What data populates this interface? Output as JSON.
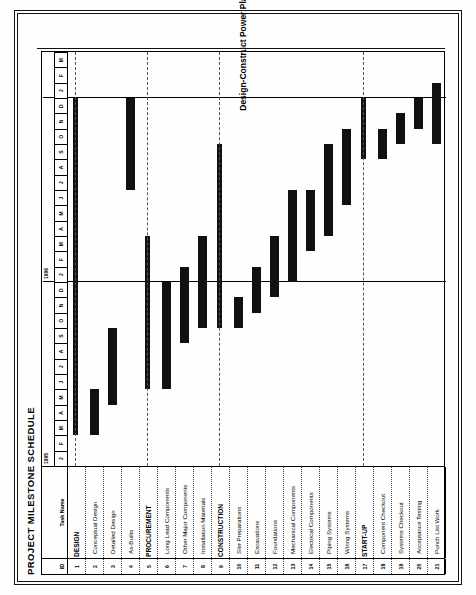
{
  "document": {
    "title": "PROJECT MILESTONE SCHEDULE",
    "caption": "Design-Construct Power Plant Project"
  },
  "columns": {
    "id_header": "ID",
    "name_header": "Task Name"
  },
  "timeline": {
    "years": [
      {
        "label": "1995",
        "start_index": 0,
        "span": 12
      },
      {
        "label": "1996",
        "start_index": 12,
        "span": 12
      },
      {
        "label": "",
        "start_index": 24,
        "span": 3
      }
    ],
    "months": [
      "J",
      "F",
      "M",
      "A",
      "M",
      "J",
      "J",
      "A",
      "S",
      "O",
      "N",
      "D",
      "J",
      "F",
      "M",
      "A",
      "M",
      "J",
      "J",
      "A",
      "S",
      "O",
      "N",
      "D",
      "J",
      "F",
      "M"
    ],
    "total_months": 27,
    "gridline_months": [
      12,
      24
    ]
  },
  "chart_data": {
    "type": "bar",
    "title": "PROJECT MILESTONE SCHEDULE",
    "subtitle": "Design-Construct Power Plant Project",
    "xlabel": "",
    "ylabel": "",
    "categories": [
      "DESIGN",
      "Conceptual Design",
      "Detailed Design",
      "As-Builts",
      "PROCUREMENT",
      "Long Lead Components",
      "Other Major Components",
      "Installation Materials",
      "CONSTRUCTION",
      "Site Preparations",
      "Excavations",
      "Foundations",
      "Mechanical Components",
      "Electrical Components",
      "Piping Systems",
      "Wiring Systems",
      "START-UP",
      "Component Checkout",
      "Systems Checkout",
      "Acceptance Testing",
      "Punch List Work"
    ],
    "tasks": [
      {
        "id": "1",
        "name": "DESIGN",
        "summary": true,
        "start_month": 2,
        "end_month": 24
      },
      {
        "id": "2",
        "name": "Conceptual Design",
        "summary": false,
        "start_month": 2,
        "end_month": 5
      },
      {
        "id": "3",
        "name": "Detailed Design",
        "summary": false,
        "start_month": 4,
        "end_month": 9
      },
      {
        "id": "4",
        "name": "As-Builts",
        "summary": false,
        "start_month": 18,
        "end_month": 24
      },
      {
        "id": "5",
        "name": "PROCUREMENT",
        "summary": true,
        "start_month": 5,
        "end_month": 15
      },
      {
        "id": "6",
        "name": "Long Lead Components",
        "summary": false,
        "start_month": 5,
        "end_month": 12
      },
      {
        "id": "7",
        "name": "Other Major Components",
        "summary": false,
        "start_month": 8,
        "end_month": 13
      },
      {
        "id": "8",
        "name": "Installation Materials",
        "summary": false,
        "start_month": 9,
        "end_month": 15
      },
      {
        "id": "9",
        "name": "CONSTRUCTION",
        "summary": true,
        "start_month": 9,
        "end_month": 21
      },
      {
        "id": "10",
        "name": "Site Preparations",
        "summary": false,
        "start_month": 9,
        "end_month": 11
      },
      {
        "id": "11",
        "name": "Excavations",
        "summary": false,
        "start_month": 10,
        "end_month": 13
      },
      {
        "id": "12",
        "name": "Foundations",
        "summary": false,
        "start_month": 11,
        "end_month": 15
      },
      {
        "id": "13",
        "name": "Mechanical Components",
        "summary": false,
        "start_month": 12,
        "end_month": 18
      },
      {
        "id": "14",
        "name": "Electrical Components",
        "summary": false,
        "start_month": 14,
        "end_month": 18
      },
      {
        "id": "15",
        "name": "Piping Systems",
        "summary": false,
        "start_month": 15,
        "end_month": 21
      },
      {
        "id": "16",
        "name": "Wiring Systems",
        "summary": false,
        "start_month": 17,
        "end_month": 22
      },
      {
        "id": "17",
        "name": "START-UP",
        "summary": true,
        "start_month": 20,
        "end_month": 24
      },
      {
        "id": "18",
        "name": "Component Checkout",
        "summary": false,
        "start_month": 20,
        "end_month": 22
      },
      {
        "id": "19",
        "name": "Systems Checkout",
        "summary": false,
        "start_month": 21,
        "end_month": 23
      },
      {
        "id": "20",
        "name": "Acceptance Testing",
        "summary": false,
        "start_month": 22,
        "end_month": 24
      },
      {
        "id": "21",
        "name": "Punch List Work",
        "summary": false,
        "start_month": 21,
        "end_month": 25
      }
    ],
    "axis_start_year": 1995,
    "axis_start_month": "J",
    "grid": true,
    "legend": "none"
  },
  "colors": {
    "bar": "#111111",
    "border": "#000000",
    "grid": "#555555",
    "background": "#ffffff"
  }
}
